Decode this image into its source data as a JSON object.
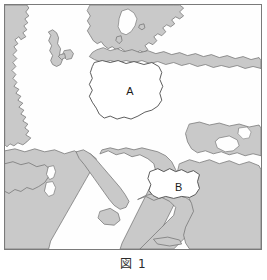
{
  "figure": {
    "caption": "図 1",
    "caption_number": "1"
  },
  "map": {
    "title": "Europe outline map",
    "projection_note": "Europe, Baltic to Mediterranean and Black Sea",
    "colors": {
      "land_fill": "#c9c9c9",
      "land_stroke": "#6b6b6b",
      "sea_fill": "#fefefe",
      "highlight_fill": "#ffffff",
      "highlight_stroke": "#4a4a4a",
      "frame_stroke": "#7a7a7a",
      "label_text": "#1a1a1a",
      "caption_text": "#2b2b2b"
    },
    "labels": [
      {
        "id": "A",
        "text": "A",
        "x": 126,
        "y": 88,
        "country": "Poland"
      },
      {
        "id": "B",
        "text": "B",
        "x": 175,
        "y": 185,
        "country": "Bulgaria"
      }
    ]
  }
}
